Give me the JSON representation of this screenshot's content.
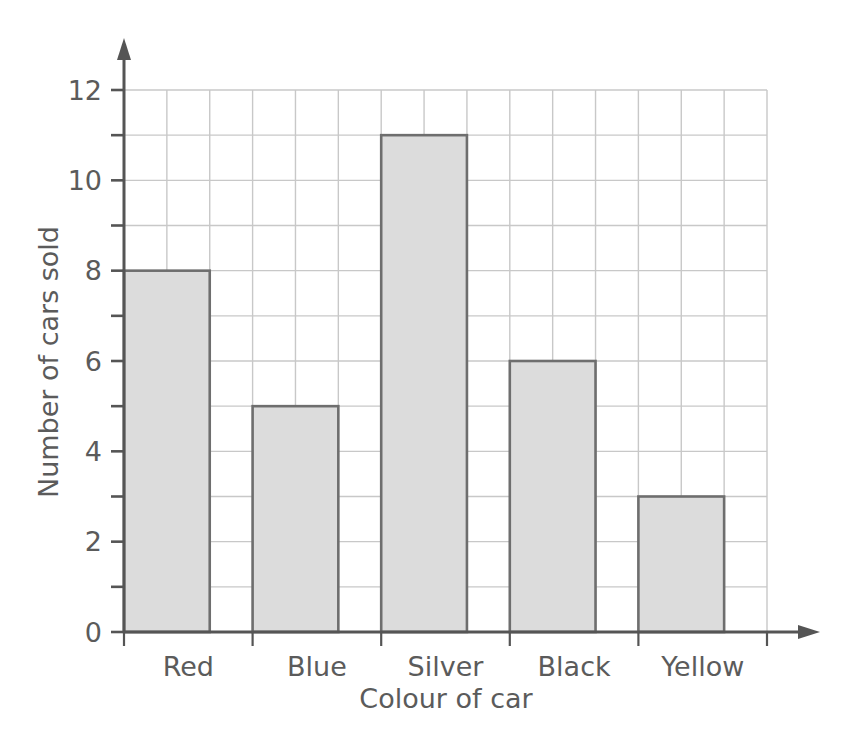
{
  "chart_data": {
    "type": "bar",
    "title": "",
    "subtitle": "",
    "xlabel": "Colour of car",
    "ylabel": "Number of cars sold",
    "categories": [
      "Red",
      "Blue",
      "Silver",
      "Black",
      "Yellow"
    ],
    "values": [
      8,
      5,
      11,
      6,
      3
    ],
    "ylim": [
      0,
      12
    ],
    "y_tick_labels": [
      "0",
      "2",
      "4",
      "6",
      "8",
      "10",
      "12"
    ],
    "y_tick_values": [
      0,
      2,
      4,
      6,
      8,
      10,
      12
    ],
    "y_minor_step": 1,
    "grid": true,
    "grid_x": true,
    "grid_y": true,
    "legend": "none",
    "annotations": [],
    "colors": {
      "bar_fill": "#dcdcdc",
      "bar_stroke": "#6e6e6e",
      "grid_line": "#c8c8c8",
      "axis_line": "#555555",
      "text": "#5b5b5b",
      "background": "#ffffff"
    },
    "axis_arrows": {
      "x_axis_arrow": true,
      "y_axis_arrow": true
    }
  }
}
